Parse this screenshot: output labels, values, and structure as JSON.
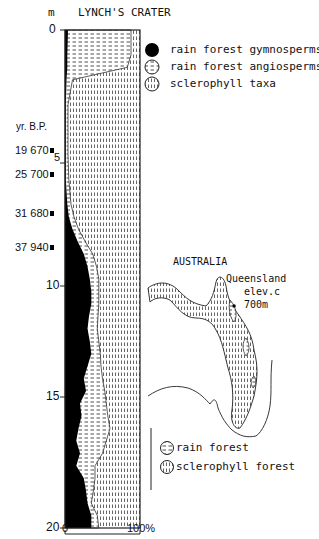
{
  "chart_data": {
    "type": "area",
    "title": "LYNCH'S CRATER",
    "ylabel": "m",
    "xlabel": "",
    "ylim": [
      0,
      20
    ],
    "xlim": [
      0,
      100
    ],
    "y_ticks": [
      "0",
      "5",
      "10",
      "15",
      "20"
    ],
    "x_ticks": [
      "0",
      "100%"
    ],
    "age_axis_label": "yr. B.P.",
    "age_markers": [
      {
        "label": "19 670",
        "depth_m": 4.6
      },
      {
        "label": "25 700",
        "depth_m": 5.6
      },
      {
        "label": "31 680",
        "depth_m": 7.6
      },
      {
        "label": "37 940",
        "depth_m": 9.0
      }
    ],
    "depth": [
      0,
      1,
      1.5,
      2,
      3,
      4,
      5,
      6,
      7,
      7.5,
      8,
      8.5,
      9,
      9.5,
      10,
      10.5,
      11,
      11.5,
      12,
      12.5,
      13,
      13.5,
      14,
      14.5,
      15,
      15.5,
      16,
      16.5,
      17,
      17.5,
      18,
      18.5,
      19,
      19.5,
      20
    ],
    "series": [
      {
        "name": "rain forest gymnosperms",
        "pattern": "solid-black",
        "values": [
          4,
          3,
          3,
          2,
          1,
          1,
          1,
          1,
          3,
          5,
          10,
          17,
          25,
          30,
          33,
          35,
          35,
          32,
          30,
          33,
          35,
          30,
          25,
          28,
          20,
          22,
          18,
          15,
          20,
          15,
          25,
          28,
          30,
          35,
          35
        ]
      },
      {
        "name": "rain forest angiosperms",
        "pattern": "horizontal-dashes",
        "values": [
          84,
          85,
          80,
          8,
          3,
          3,
          3,
          4,
          5,
          7,
          8,
          10,
          12,
          12,
          12,
          10,
          10,
          12,
          13,
          12,
          12,
          18,
          25,
          25,
          35,
          35,
          42,
          40,
          30,
          25,
          15,
          10,
          5,
          8,
          10
        ]
      },
      {
        "name": "sclerophyll taxa",
        "pattern": "vertical-dashes",
        "values": [
          12,
          12,
          17,
          90,
          96,
          96,
          96,
          95,
          92,
          88,
          82,
          73,
          63,
          58,
          55,
          55,
          55,
          56,
          57,
          55,
          53,
          52,
          50,
          47,
          45,
          43,
          40,
          45,
          50,
          60,
          60,
          62,
          65,
          57,
          55
        ]
      }
    ],
    "legend_position": "right-top",
    "grid": false
  },
  "legend": {
    "items": [
      {
        "label": "rain forest gymnosperms",
        "pattern": "solid-black"
      },
      {
        "label": "rain forest angiosperms",
        "pattern": "horizontal-dashes"
      },
      {
        "label": "sclerophyll taxa",
        "pattern": "vertical-dashes"
      }
    ]
  },
  "inset_map": {
    "title": "AUSTRALIA",
    "site_label": "Queensland",
    "elevation_label": "elev.c",
    "elevation_value": "700m",
    "legend": [
      {
        "label": "rain forest",
        "pattern": "horizontal-dashes"
      },
      {
        "label": "sclerophyll forest",
        "pattern": "vertical-dashes"
      }
    ]
  }
}
